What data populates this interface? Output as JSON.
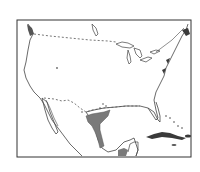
{
  "map": {
    "type": "range map",
    "region": "United States, Mexico and Caribbean",
    "colors": {
      "background": "#ffffff",
      "frame": "#333333",
      "coastline": "#444444",
      "range_fill": "#7a7a7a",
      "islands": "#3a3a3a",
      "dashed_boundary": "#555555"
    },
    "features": [
      {
        "name": "country-borders",
        "style": "dashed"
      },
      {
        "name": "shaded-range",
        "location": "south Texas / northeastern Mexico Gulf coast"
      },
      {
        "name": "southern-mexico-shaded",
        "location": "Yucatan isthmus base"
      }
    ]
  }
}
